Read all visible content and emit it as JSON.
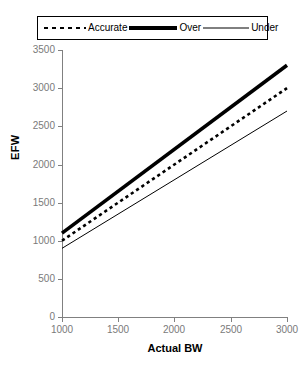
{
  "chart_data": {
    "type": "line",
    "title": "",
    "xlabel": "Actual BW",
    "ylabel": "EFW",
    "xlim": [
      1000,
      3000
    ],
    "ylim": [
      0,
      3500
    ],
    "x": [
      1000,
      3000
    ],
    "xticks": [
      "1000",
      "1500",
      "2000",
      "2500",
      "3000"
    ],
    "yticks": [
      "0",
      "500",
      "1000",
      "1500",
      "2000",
      "2500",
      "3000",
      "3500"
    ],
    "grid": false,
    "legend_position": "top",
    "series": [
      {
        "name": "Accurate",
        "values": [
          1000,
          3000
        ],
        "style": "dashed"
      },
      {
        "name": "Over",
        "values": [
          1100,
          3300
        ],
        "style": "thick-solid"
      },
      {
        "name": "Under",
        "values": [
          900,
          2700
        ],
        "style": "thin-solid"
      }
    ]
  },
  "legend": {
    "items": [
      {
        "label": "Accurate",
        "icon": "dashed-line-icon"
      },
      {
        "label": "Over",
        "icon": "thick-line-icon"
      },
      {
        "label": "Under",
        "icon": "thin-line-icon"
      }
    ]
  },
  "axes": {
    "y": {
      "title": "EFW",
      "ticks": [
        "3500",
        "3000",
        "2500",
        "2000",
        "1500",
        "1000",
        "500",
        "0"
      ]
    },
    "x": {
      "title": "Actual BW",
      "ticks": [
        "1000",
        "1500",
        "2000",
        "2500",
        "3000"
      ]
    }
  },
  "colors": {
    "line": "#000000",
    "axis": "#808080",
    "tick_label": "#7a7a7a",
    "background": "#ffffff"
  }
}
